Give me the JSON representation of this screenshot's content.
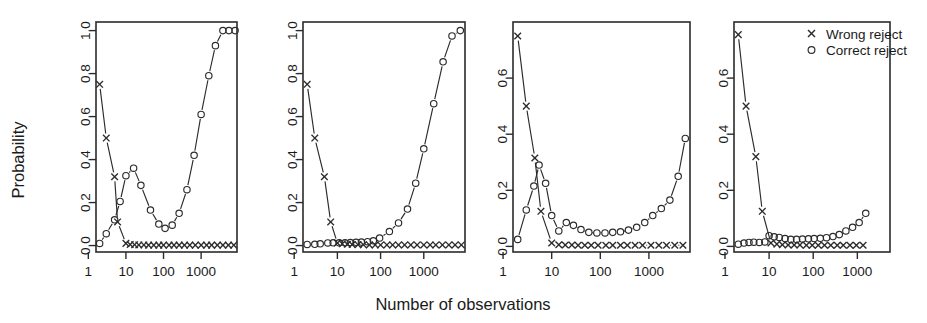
{
  "figure": {
    "xlabel": "Number of observations",
    "ylabel": "Probability",
    "legend": {
      "entries": [
        {
          "label": "Wrong reject",
          "marker": "cross-marker"
        },
        {
          "label": "Correct reject",
          "marker": "circle-marker"
        }
      ],
      "position": "top-right of panel 4"
    },
    "axis_color": "#2b2b2b",
    "background": "#ffffff"
  },
  "chart_data": [
    {
      "type": "scatter",
      "panel": 1,
      "title": "",
      "xlabel": "Number of observations",
      "ylabel": "Probability",
      "xscale": "log10",
      "xlim": [
        1.6,
        9000
      ],
      "ylim": [
        -0.03,
        1.04
      ],
      "xticks": [
        1,
        10,
        100,
        1000
      ],
      "xticklabels": [
        "1",
        "10",
        "100",
        "1000"
      ],
      "yticks": [
        0.0,
        0.2,
        0.4,
        0.6,
        0.8,
        1.0
      ],
      "yticklabels": [
        "0.0",
        "0.2",
        "0.4",
        "0.6",
        "0.8",
        "1.0"
      ],
      "grid": false,
      "series": [
        {
          "name": "Wrong reject",
          "marker": "x",
          "x": [
            2,
            3,
            5,
            6,
            10,
            13,
            17,
            22,
            30,
            40,
            55,
            75,
            100,
            140,
            190,
            260,
            360,
            500,
            700,
            1000,
            1400,
            1900,
            2700,
            3800,
            5300,
            7400
          ],
          "y": [
            0.75,
            0.5,
            0.32,
            0.11,
            0.01,
            0.005,
            0.004,
            0.003,
            0.003,
            0.002,
            0.002,
            0.002,
            0.002,
            0.002,
            0.002,
            0.002,
            0.002,
            0.002,
            0.002,
            0.002,
            0.002,
            0.002,
            0.002,
            0.002,
            0.002,
            0.002
          ]
        },
        {
          "name": "Correct reject",
          "marker": "o",
          "x": [
            2,
            3,
            5,
            7,
            10,
            16,
            25,
            45,
            75,
            110,
            170,
            260,
            420,
            650,
            1000,
            1600,
            2400,
            3800,
            5500,
            8000
          ],
          "y": [
            0.01,
            0.055,
            0.12,
            0.205,
            0.325,
            0.36,
            0.28,
            0.165,
            0.1,
            0.08,
            0.095,
            0.15,
            0.26,
            0.42,
            0.61,
            0.79,
            0.93,
            1.0,
            1.0,
            1.0
          ]
        }
      ]
    },
    {
      "type": "scatter",
      "panel": 2,
      "title": "",
      "xlabel": "Number of observations",
      "ylabel": "Probability",
      "xscale": "log10",
      "xlim": [
        1.6,
        9000
      ],
      "ylim": [
        -0.03,
        1.04
      ],
      "xticks": [
        1,
        10,
        100,
        1000
      ],
      "xticklabels": [
        "1",
        "10",
        "100",
        "1000"
      ],
      "yticks": [
        0.0,
        0.2,
        0.4,
        0.6,
        0.8,
        1.0
      ],
      "yticklabels": [
        "0.0",
        "0.2",
        "0.4",
        "0.6",
        "0.8",
        "1.0"
      ],
      "grid": false,
      "series": [
        {
          "name": "Wrong reject",
          "marker": "x",
          "x": [
            2,
            3,
            5,
            7,
            10,
            13,
            17,
            22,
            30,
            40,
            55,
            75,
            100,
            140,
            190,
            260,
            360,
            500,
            700,
            1000,
            1400,
            1900,
            2700,
            3800,
            5300,
            7400
          ],
          "y": [
            0.75,
            0.5,
            0.32,
            0.11,
            0.012,
            0.008,
            0.006,
            0.005,
            0.004,
            0.004,
            0.003,
            0.003,
            0.003,
            0.003,
            0.003,
            0.003,
            0.003,
            0.003,
            0.003,
            0.003,
            0.003,
            0.003,
            0.003,
            0.003,
            0.003,
            0.003
          ]
        },
        {
          "name": "Correct reject",
          "marker": "o",
          "x": [
            2,
            3,
            4,
            6,
            8,
            11,
            15,
            20,
            27,
            36,
            50,
            68,
            95,
            160,
            260,
            420,
            650,
            1000,
            1700,
            2800,
            4500,
            7000
          ],
          "y": [
            0.005,
            0.006,
            0.008,
            0.012,
            0.013,
            0.013,
            0.013,
            0.014,
            0.015,
            0.016,
            0.018,
            0.022,
            0.035,
            0.065,
            0.105,
            0.17,
            0.29,
            0.45,
            0.66,
            0.855,
            0.975,
            1.0
          ]
        }
      ]
    },
    {
      "type": "scatter",
      "panel": 3,
      "title": "",
      "xlabel": "Number of observations",
      "ylabel": "Probability",
      "xscale": "log10",
      "xlim": [
        1.6,
        7000
      ],
      "ylim": [
        -0.02,
        0.8
      ],
      "xticks": [
        1,
        10,
        100,
        1000
      ],
      "xticklabels": [
        "1",
        "10",
        "100",
        "1000"
      ],
      "yticks": [
        0.0,
        0.2,
        0.4,
        0.6
      ],
      "yticklabels": [
        "0.0",
        "0.2",
        "0.4",
        "0.6"
      ],
      "grid": false,
      "series": [
        {
          "name": "Wrong reject",
          "marker": "x",
          "x": [
            2,
            3,
            4.5,
            6,
            10,
            14,
            19,
            26,
            35,
            48,
            65,
            90,
            130,
            180,
            260,
            360,
            520,
            740,
            1100,
            1600,
            2300,
            3400,
            5000
          ],
          "y": [
            0.75,
            0.5,
            0.315,
            0.125,
            0.012,
            0.006,
            0.005,
            0.005,
            0.004,
            0.004,
            0.004,
            0.004,
            0.004,
            0.004,
            0.004,
            0.004,
            0.004,
            0.004,
            0.004,
            0.004,
            0.004,
            0.004,
            0.004
          ]
        },
        {
          "name": "Correct reject",
          "marker": "o",
          "x": [
            2,
            3,
            4.3,
            5.5,
            7.5,
            10,
            14,
            20,
            28,
            40,
            58,
            85,
            125,
            180,
            260,
            380,
            560,
            820,
            1200,
            1800,
            2700,
            4000,
            5600
          ],
          "y": [
            0.025,
            0.13,
            0.215,
            0.29,
            0.225,
            0.11,
            0.055,
            0.085,
            0.075,
            0.06,
            0.05,
            0.048,
            0.048,
            0.05,
            0.052,
            0.058,
            0.068,
            0.085,
            0.11,
            0.135,
            0.165,
            0.25,
            0.385
          ]
        }
      ]
    },
    {
      "type": "scatter",
      "panel": 4,
      "title": "",
      "xlabel": "Number of observations",
      "ylabel": "Probability",
      "xscale": "log10",
      "xlim": [
        1.6,
        5500
      ],
      "ylim": [
        -0.02,
        0.8
      ],
      "xticks": [
        1,
        10,
        100,
        1000
      ],
      "xticklabels": [
        "1",
        "10",
        "100",
        "1000"
      ],
      "yticks": [
        0.0,
        0.2,
        0.4,
        0.6
      ],
      "yticklabels": [
        "0.0",
        "0.2",
        "0.4",
        "0.6"
      ],
      "grid": false,
      "series": [
        {
          "name": "Wrong reject",
          "marker": "x",
          "x": [
            2,
            3,
            5,
            7,
            11,
            15,
            20,
            27,
            37,
            50,
            70,
            95,
            130,
            180,
            250,
            350,
            480,
            680,
            950,
            1350
          ],
          "y": [
            0.755,
            0.5,
            0.32,
            0.125,
            0.012,
            0.008,
            0.006,
            0.005,
            0.005,
            0.005,
            0.004,
            0.004,
            0.004,
            0.004,
            0.004,
            0.004,
            0.004,
            0.004,
            0.004,
            0.004
          ]
        },
        {
          "name": "Correct reject",
          "marker": "o",
          "x": [
            2,
            2.7,
            3.5,
            4.5,
            6,
            8,
            10,
            13,
            17,
            23,
            31,
            42,
            57,
            78,
            105,
            145,
            200,
            280,
            390,
            550,
            780,
            1100,
            1550
          ],
          "y": [
            0.008,
            0.012,
            0.014,
            0.015,
            0.014,
            0.016,
            0.038,
            0.034,
            0.032,
            0.028,
            0.025,
            0.025,
            0.026,
            0.027,
            0.028,
            0.029,
            0.031,
            0.035,
            0.042,
            0.055,
            0.068,
            0.085,
            0.118
          ]
        }
      ]
    }
  ]
}
